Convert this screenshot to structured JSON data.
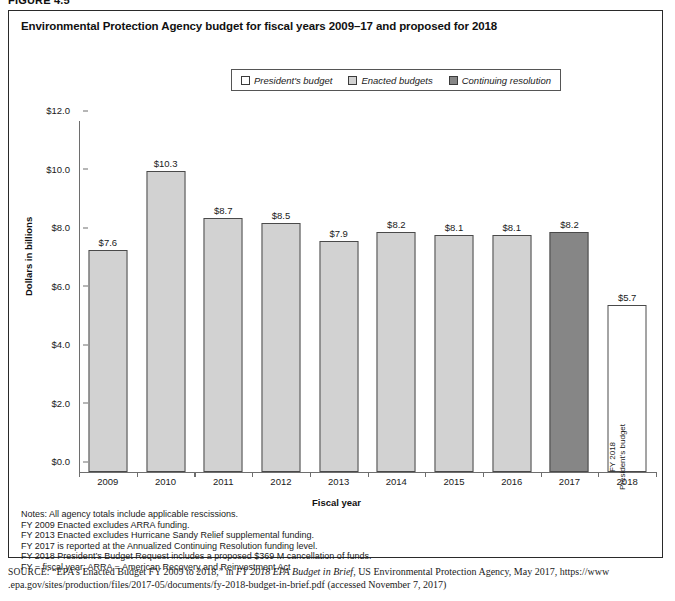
{
  "figure": {
    "number": "FIGURE 4.5",
    "title": "Environmental Protection Agency budget for fiscal years 2009–17 and proposed for 2018"
  },
  "legend": {
    "items": [
      {
        "label": "President's budget",
        "color": "#ffffff",
        "key": "president"
      },
      {
        "label": "Enacted budgets",
        "color": "#d2d2d2",
        "key": "enacted"
      },
      {
        "label": "Continuing resolution",
        "color": "#868686",
        "key": "cr"
      }
    ]
  },
  "chart_data": {
    "type": "bar",
    "title": "Environmental Protection Agency budget for fiscal years 2009–17 and proposed for 2018",
    "xlabel": "Fiscal year",
    "ylabel": "Dollars in billions",
    "categories": [
      "2009",
      "2010",
      "2011",
      "2012",
      "2013",
      "2014",
      "2015",
      "2016",
      "2017",
      "2018"
    ],
    "values": [
      7.6,
      10.3,
      8.7,
      8.5,
      7.9,
      8.2,
      8.1,
      8.1,
      8.2,
      5.7
    ],
    "value_labels": [
      "$7.6",
      "$10.3",
      "$8.7",
      "$8.5",
      "$7.9",
      "$8.2",
      "$8.1",
      "$8.1",
      "$8.2",
      "$5.7"
    ],
    "series_types": [
      "enacted",
      "enacted",
      "enacted",
      "enacted",
      "enacted",
      "enacted",
      "enacted",
      "enacted",
      "cr",
      "president"
    ],
    "ylim": [
      0.0,
      12.0
    ],
    "ytick_labels": [
      "$0.0",
      "$2.0",
      "$4.0",
      "$6.0",
      "$8.0",
      "$10.0",
      "$12.0"
    ],
    "ytick_values": [
      0.0,
      2.0,
      4.0,
      6.0,
      8.0,
      10.0,
      12.0
    ],
    "grid": false,
    "legend_position": "top-center",
    "annotations": [
      {
        "category": "2018",
        "text_lines": [
          "FY 2018",
          "President's budget"
        ],
        "orientation": "vertical"
      }
    ]
  },
  "notes": [
    "Notes: All agency totals include applicable rescissions.",
    "FY 2009 Enacted excludes ARRA funding.",
    "FY 2013 Enacted excludes Hurricane Sandy Relief supplemental funding.",
    "FY 2017 is reported at the Annualized Continuing Resolution funding level.",
    "FY 2018 President’s Budget Request includes a proposed $369 M cancellation of funds.",
    "FY = fiscal year; ARRA = American Recovery and Reinvestment Act"
  ],
  "source": {
    "label": "SOURCE:",
    "quoted_title": "“EPA’s Enacted Budget FY 2009 to 2018,”",
    "in_word": "in",
    "publication": "FY 2018 EPA Budget in Brief",
    "publisher": ", US Environmental Protection Agency, May 2017, https://www",
    "url_line": ".epa.gov/sites/production/files/2017-05/documents/fy-2018-budget-in-brief.pdf (accessed November 7, 2017)"
  }
}
